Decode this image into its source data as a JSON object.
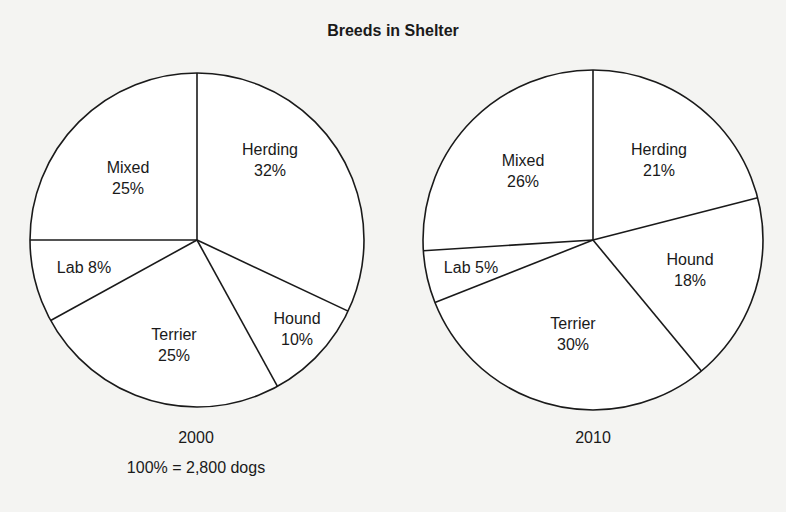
{
  "title": "Breeds in Shelter",
  "pies": [
    {
      "year": "2000",
      "note": "100% = 2,800 dogs",
      "slices": [
        {
          "name": "Herding",
          "pct": "32%"
        },
        {
          "name": "Hound",
          "pct": "10%"
        },
        {
          "name": "Terrier",
          "pct": "25%"
        },
        {
          "name": "Lab",
          "pct": "8%"
        },
        {
          "name": "Mixed",
          "pct": "25%"
        }
      ]
    },
    {
      "year": "2010",
      "slices": [
        {
          "name": "Herding",
          "pct": "21%"
        },
        {
          "name": "Hound",
          "pct": "18%"
        },
        {
          "name": "Terrier",
          "pct": "30%"
        },
        {
          "name": "Lab",
          "pct": "5%"
        },
        {
          "name": "Mixed",
          "pct": "26%"
        }
      ]
    }
  ],
  "chart_data": [
    {
      "type": "pie",
      "title": "Breeds in Shelter",
      "subtitle": "2000",
      "annotation": "100% = 2,800 dogs",
      "categories": [
        "Herding",
        "Hound",
        "Terrier",
        "Lab",
        "Mixed"
      ],
      "values": [
        32,
        10,
        25,
        8,
        25
      ],
      "unit": "%"
    },
    {
      "type": "pie",
      "title": "Breeds in Shelter",
      "subtitle": "2010",
      "categories": [
        "Herding",
        "Hound",
        "Terrier",
        "Lab",
        "Mixed"
      ],
      "values": [
        21,
        18,
        30,
        5,
        26
      ],
      "unit": "%"
    }
  ]
}
